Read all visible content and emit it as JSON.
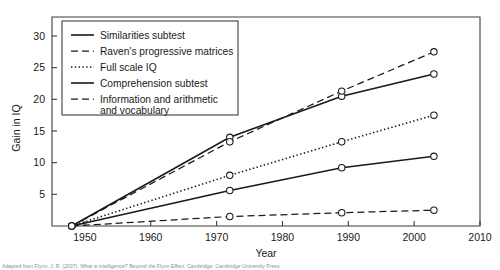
{
  "figure": {
    "background": "#ffffff",
    "ink_color": "#1a1a1a",
    "axis_color": "#3d3d3d"
  },
  "caption": {
    "text": "Adapted from Flynn, J. R. (2007). What is intelligence? Beyond the Flynn Effect. Cambridge: Cambridge University Press."
  },
  "chart_data": {
    "type": "line",
    "title": "",
    "xlabel": "Year",
    "ylabel": "Gain in IQ",
    "xlim": [
      1945,
      2010
    ],
    "ylim": [
      0,
      33
    ],
    "xticks": [
      1950,
      1960,
      1970,
      1980,
      1990,
      2000,
      2010
    ],
    "xtick_labels": [
      "1950",
      "1960",
      "1970",
      "1980",
      "1990",
      "2000",
      "2010"
    ],
    "yticks": [
      5,
      10,
      15,
      20,
      25,
      30
    ],
    "ytick_labels": [
      "5",
      "10",
      "15",
      "20",
      "25",
      "30"
    ],
    "grid": false,
    "legend_position": "upper-left-inside",
    "markers": "open-circle",
    "series": [
      {
        "name": "Similarities subtest",
        "style": "solid",
        "x": [
          1948,
          1972,
          1989,
          2003
        ],
        "values": [
          0,
          14.0,
          20.5,
          24.0
        ]
      },
      {
        "name": "Raven's progressive matrices",
        "style": "dashed",
        "x": [
          1948,
          1972,
          1989,
          2003
        ],
        "values": [
          0,
          13.3,
          21.3,
          27.5
        ]
      },
      {
        "name": "Full scale IQ",
        "style": "dotted",
        "x": [
          1948,
          1972,
          1989,
          2003
        ],
        "values": [
          0,
          8.0,
          13.3,
          17.5
        ]
      },
      {
        "name": "Comprehension subtest",
        "style": "solid",
        "x": [
          1948,
          1972,
          1989,
          2003
        ],
        "values": [
          0,
          5.6,
          9.2,
          11.0
        ]
      },
      {
        "name": "Information and arithmetic and vocabulary",
        "style": "dashed",
        "x": [
          1948,
          1972,
          1989,
          2003
        ],
        "values": [
          0,
          1.5,
          2.1,
          2.5
        ]
      }
    ],
    "legend_entries": [
      {
        "label": "Similarities subtest",
        "style": "solid",
        "line2": ""
      },
      {
        "label": "Raven's progressive matrices",
        "style": "dashed",
        "line2": ""
      },
      {
        "label": "Full scale IQ",
        "style": "dotted",
        "line2": ""
      },
      {
        "label": "Comprehension subtest",
        "style": "solid",
        "line2": ""
      },
      {
        "label": "Information and arithmetic",
        "style": "dashed",
        "line2": "and vocabulary"
      }
    ]
  }
}
